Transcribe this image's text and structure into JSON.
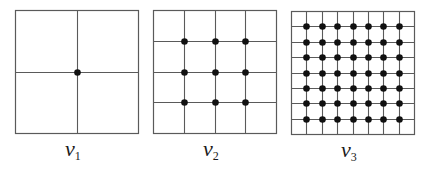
{
  "diagram": {
    "title": "",
    "line_color": "#5a5a5a",
    "dot_color": "#111111",
    "panels": [
      {
        "id": "v1",
        "label": "ν",
        "subscript": "1",
        "box": {
          "x": 15,
          "y": 10,
          "size": 123
        },
        "divisions": 2,
        "grid_points": 1
      },
      {
        "id": "v2",
        "label": "ν",
        "subscript": "2",
        "box": {
          "x": 153,
          "y": 10,
          "size": 123
        },
        "divisions": 4,
        "grid_points": 9
      },
      {
        "id": "v3",
        "label": "ν",
        "subscript": "3",
        "box": {
          "x": 291,
          "y": 11,
          "size": 123
        },
        "divisions": 8,
        "grid_points": 49
      }
    ]
  }
}
